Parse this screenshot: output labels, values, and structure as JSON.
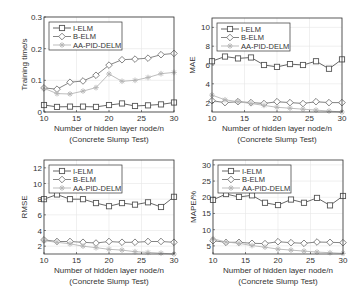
{
  "figure": {
    "colors": {
      "I-ELM": "#555555",
      "B-ELM": "#777777",
      "AA-PID-DELM": "#b5b5b5",
      "frame": "#333333",
      "grid": "#e6e6e6"
    }
  },
  "chart_data": [
    {
      "type": "line",
      "title": "",
      "xlabel": "Number of hidden layer node/n",
      "subtitle": "(Concrete Slump Test)",
      "ylabel": "Training time/s",
      "x": [
        10,
        12,
        14,
        16,
        18,
        20,
        22,
        24,
        26,
        28,
        30
      ],
      "xlim": [
        10,
        30
      ],
      "ylim": [
        0,
        0.3
      ],
      "xticks": [
        10,
        15,
        20,
        25,
        30
      ],
      "yticks": [
        0,
        0.1,
        0.2,
        0.3
      ],
      "ytick_labels": [
        "0",
        "0.1",
        "0.2",
        "0.3"
      ],
      "grid": true,
      "legend_position": "upper left",
      "series": [
        {
          "name": "I-ELM",
          "marker": "square",
          "values": [
            0.022,
            0.016,
            0.017,
            0.017,
            0.016,
            0.022,
            0.027,
            0.019,
            0.021,
            0.024,
            0.03
          ]
        },
        {
          "name": "B-ELM",
          "marker": "diamond",
          "values": [
            0.076,
            0.072,
            0.094,
            0.098,
            0.116,
            0.148,
            0.165,
            0.167,
            0.17,
            0.181,
            0.185
          ]
        },
        {
          "name": "AA-PID-DELM",
          "marker": "star",
          "values": [
            0.075,
            0.058,
            0.057,
            0.066,
            0.077,
            0.12,
            0.097,
            0.1,
            0.109,
            0.121,
            0.125
          ]
        }
      ]
    },
    {
      "type": "line",
      "title": "",
      "xlabel": "Number of hidden layer node/n",
      "subtitle": "(Concrete Slump Test)",
      "ylabel": "MAE",
      "x": [
        10,
        12,
        14,
        16,
        18,
        20,
        22,
        24,
        26,
        28,
        30
      ],
      "xlim": [
        10,
        30
      ],
      "ylim": [
        1,
        11
      ],
      "xticks": [
        10,
        15,
        20,
        25,
        30
      ],
      "yticks": [
        2,
        4,
        6,
        8,
        10
      ],
      "ytick_labels": [
        "2",
        "4",
        "6",
        "8",
        "10"
      ],
      "grid": true,
      "legend_position": "upper left",
      "series": [
        {
          "name": "I-ELM",
          "marker": "square",
          "values": [
            6.4,
            6.9,
            6.7,
            6.8,
            6.0,
            5.8,
            6.1,
            6.0,
            6.4,
            5.6,
            6.6
          ]
        },
        {
          "name": "B-ELM",
          "marker": "diamond",
          "values": [
            2.2,
            2.0,
            2.1,
            2.0,
            1.9,
            2.1,
            2.0,
            1.9,
            2.1,
            2.0,
            2.0
          ]
        },
        {
          "name": "AA-PID-DELM",
          "marker": "star",
          "values": [
            2.8,
            2.3,
            2.1,
            1.9,
            1.7,
            1.5,
            1.4,
            1.3,
            1.2,
            1.1,
            1.0
          ]
        }
      ]
    },
    {
      "type": "line",
      "title": "",
      "xlabel": "Number of hidden layer node/n",
      "subtitle": "(Concrete Slump Test)",
      "ylabel": "RMSE",
      "x": [
        10,
        12,
        14,
        16,
        18,
        20,
        22,
        24,
        26,
        28,
        30
      ],
      "xlim": [
        10,
        30
      ],
      "ylim": [
        1,
        13
      ],
      "xticks": [
        10,
        15,
        20,
        25,
        30
      ],
      "yticks": [
        2,
        4,
        6,
        8,
        10,
        12
      ],
      "ytick_labels": [
        "2",
        "4",
        "6",
        "8",
        "10",
        "12"
      ],
      "grid": true,
      "legend_position": "upper left",
      "series": [
        {
          "name": "I-ELM",
          "marker": "square",
          "values": [
            8.0,
            8.6,
            8.0,
            8.0,
            7.5,
            7.1,
            7.5,
            7.3,
            7.6,
            7.0,
            8.3
          ]
        },
        {
          "name": "B-ELM",
          "marker": "diamond",
          "values": [
            2.8,
            2.6,
            2.6,
            2.5,
            2.4,
            2.6,
            2.5,
            2.5,
            2.6,
            2.6,
            2.5
          ]
        },
        {
          "name": "AA-PID-DELM",
          "marker": "star",
          "values": [
            2.7,
            2.5,
            2.3,
            2.0,
            1.8,
            1.6,
            1.5,
            1.3,
            1.2,
            1.1,
            1.0
          ]
        }
      ]
    },
    {
      "type": "line",
      "title": "",
      "xlabel": "Number of hidden layer node/n",
      "subtitle": "(Concrete Slump Test)",
      "ylabel": "MAPE/%",
      "x": [
        10,
        12,
        14,
        16,
        18,
        20,
        22,
        24,
        26,
        28,
        30
      ],
      "xlim": [
        10,
        30
      ],
      "ylim": [
        2.5,
        31.5
      ],
      "xticks": [
        10,
        15,
        20,
        25,
        30
      ],
      "yticks": [
        5,
        10,
        15,
        20,
        25,
        30
      ],
      "ytick_labels": [
        "5",
        "10",
        "15",
        "20",
        "25",
        "30"
      ],
      "grid": true,
      "legend_position": "upper left",
      "series": [
        {
          "name": "I-ELM",
          "marker": "square",
          "values": [
            19.2,
            21.0,
            20.1,
            20.6,
            18.3,
            17.6,
            19.3,
            18.3,
            19.8,
            17.5,
            20.4
          ]
        },
        {
          "name": "B-ELM",
          "marker": "diamond",
          "values": [
            6.6,
            6.1,
            6.1,
            5.8,
            5.7,
            6.3,
            6.0,
            5.8,
            6.2,
            6.1,
            6.0
          ]
        },
        {
          "name": "AA-PID-DELM",
          "marker": "star",
          "values": [
            7.2,
            6.2,
            5.8,
            5.1,
            4.6,
            4.0,
            3.7,
            3.4,
            3.1,
            2.9,
            2.7
          ]
        }
      ]
    }
  ],
  "panels": [
    {
      "frame": [
        44,
        17,
        174,
        112
      ]
    },
    {
      "frame": [
        212,
        18,
        342,
        112
      ]
    },
    {
      "frame": [
        44,
        160,
        174,
        254
      ]
    },
    {
      "frame": [
        213,
        160,
        343,
        254
      ]
    }
  ]
}
